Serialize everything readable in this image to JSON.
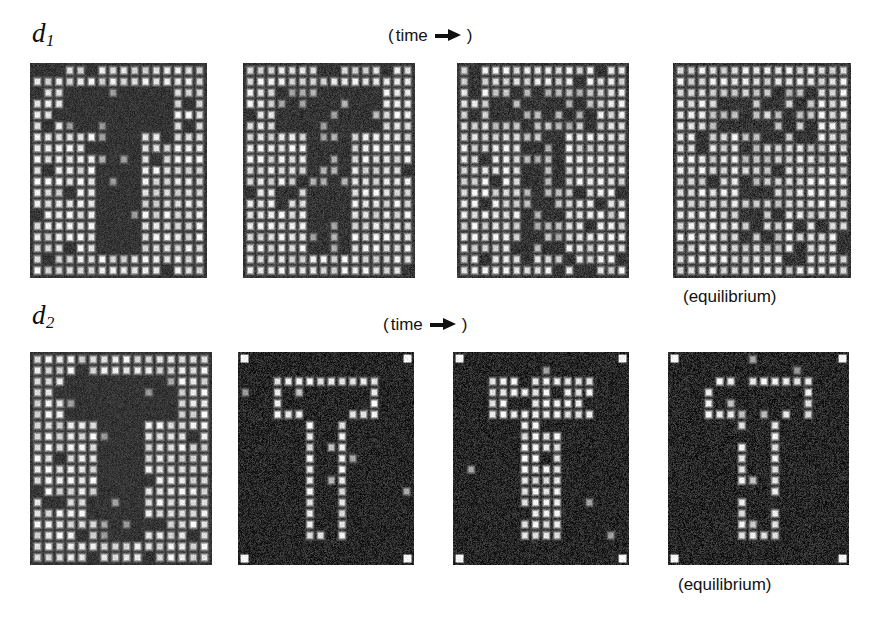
{
  "figure": {
    "background_color": "#ffffff",
    "width": 871,
    "height": 625
  },
  "rows": [
    {
      "id": "row-d1",
      "label": "d",
      "label_sub": "1",
      "time_caption": {
        "open": "(",
        "word": "time",
        "arrow": "right-arrow-icon",
        "close": ")"
      },
      "equilibrium_caption": "(equilibrium)",
      "panels": [
        {
          "id": "d1-t0",
          "stage": "initial",
          "pattern": "dark-T-filled",
          "bg_level": "bright-lattice",
          "noise": 0.12,
          "contrast": 1.0
        },
        {
          "id": "d1-t1",
          "stage": "intermediate-1",
          "pattern": "dark-T-thin",
          "bg_level": "bright-lattice",
          "noise": 0.18,
          "contrast": 0.8
        },
        {
          "id": "d1-t2",
          "stage": "intermediate-2",
          "pattern": "dark-T-faint",
          "bg_level": "bright-lattice",
          "noise": 0.24,
          "contrast": 0.58
        },
        {
          "id": "d1-t3",
          "stage": "equilibrium",
          "pattern": "dark-T-dissolved",
          "bg_level": "bright-lattice",
          "noise": 0.3,
          "contrast": 0.34
        }
      ]
    },
    {
      "id": "row-d2",
      "label": "d",
      "label_sub": "2",
      "time_caption": {
        "open": "(",
        "word": "time",
        "arrow": "right-arrow-icon",
        "close": ")"
      },
      "equilibrium_caption": "(equilibrium)",
      "panels": [
        {
          "id": "d2-t0",
          "stage": "initial",
          "pattern": "dark-T-filled",
          "bg_level": "bright-lattice",
          "noise": 0.12,
          "contrast": 1.0
        },
        {
          "id": "d2-t1",
          "stage": "intermediate-1",
          "pattern": "bright-T-outline",
          "bg_level": "dark-lattice",
          "noise": 0.22,
          "contrast": 1.0,
          "corner_markers": true
        },
        {
          "id": "d2-t2",
          "stage": "intermediate-2",
          "pattern": "bright-T-filled",
          "bg_level": "dark-lattice",
          "noise": 0.22,
          "contrast": 1.0,
          "corner_markers": true
        },
        {
          "id": "d2-t3",
          "stage": "equilibrium",
          "pattern": "bright-T-outline",
          "bg_level": "dark-lattice",
          "noise": 0.26,
          "contrast": 1.0,
          "corner_markers": true
        }
      ]
    }
  ],
  "layout": {
    "panel_geometry": [
      {
        "id": "d1-t0",
        "x": 30,
        "y": 63,
        "w": 177,
        "h": 215
      },
      {
        "id": "d1-t1",
        "x": 243,
        "y": 63,
        "w": 172,
        "h": 215
      },
      {
        "id": "d1-t2",
        "x": 457,
        "y": 63,
        "w": 172,
        "h": 215
      },
      {
        "id": "d1-t3",
        "x": 673,
        "y": 63,
        "w": 178,
        "h": 215
      },
      {
        "id": "d2-t0",
        "x": 30,
        "y": 352,
        "w": 182,
        "h": 213
      },
      {
        "id": "d2-t1",
        "x": 238,
        "y": 352,
        "w": 176,
        "h": 213
      },
      {
        "id": "d2-t2",
        "x": 453,
        "y": 352,
        "w": 176,
        "h": 213
      },
      {
        "id": "d2-t3",
        "x": 668,
        "y": 352,
        "w": 181,
        "h": 213
      }
    ],
    "label_positions": [
      {
        "id": "label-d1",
        "x": 32,
        "y": 20
      },
      {
        "id": "time-caption-1",
        "x": 388,
        "y": 27
      },
      {
        "id": "equilibrium-1",
        "x": 683,
        "y": 288
      },
      {
        "id": "label-d2",
        "x": 32,
        "y": 302
      },
      {
        "id": "time-caption-2",
        "x": 383,
        "y": 316
      },
      {
        "id": "equilibrium-2",
        "x": 678,
        "y": 576
      }
    ]
  },
  "lattice": {
    "columns": 16,
    "rows": 19,
    "site_spacing_px": 11,
    "bright_site_color": "#f2f2f2",
    "dark_site_color": "#2b2b2b",
    "background_color": "#343434"
  },
  "chart_data": {
    "type": "heatmap",
    "title": "",
    "xlabel": "",
    "ylabel": "",
    "series": [
      {
        "name": "d1",
        "frames": [
          "initial",
          "intermediate-1",
          "intermediate-2",
          "equilibrium"
        ],
        "pattern_contrast": [
          1.0,
          0.8,
          0.58,
          0.34
        ],
        "polarity": "dark-T-on-bright-lattice"
      },
      {
        "name": "d2",
        "frames": [
          "initial",
          "intermediate-1",
          "intermediate-2",
          "equilibrium"
        ],
        "pattern_contrast": [
          1.0,
          1.0,
          1.0,
          1.0
        ],
        "polarity": "bright-T-on-dark-lattice"
      }
    ],
    "grid": false,
    "legend": "none"
  }
}
